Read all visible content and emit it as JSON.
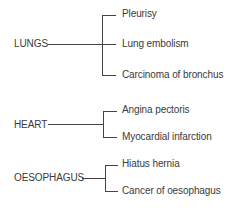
{
  "diagram": {
    "type": "tree",
    "groups": [
      {
        "label": "LUNGS",
        "children": [
          "Pleurisy",
          "Lung embolism",
          "Carcinoma of bronchus"
        ]
      },
      {
        "label": "HEART",
        "children": [
          "Angina pectoris",
          "Myocardial infarction"
        ]
      },
      {
        "label": "OESOPHAGUS",
        "children": [
          "Hiatus hernia",
          "Cancer of oesophagus"
        ]
      }
    ]
  }
}
